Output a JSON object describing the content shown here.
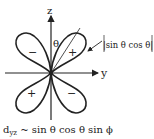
{
  "diagram": {
    "axes": {
      "vertical": "z",
      "horizontal": "y",
      "angle": "θ"
    },
    "lobes": [
      {
        "position": "upper-left",
        "sign": "−"
      },
      {
        "position": "upper-right",
        "sign": "+"
      },
      {
        "position": "lower-left",
        "sign": "+"
      },
      {
        "position": "lower-right",
        "sign": "−"
      }
    ],
    "annotation": "|sin θ cos θ|",
    "caption_main": "d",
    "caption_sub": "yz",
    "caption_rest": " ~ sin θ cos θ sin ϕ",
    "colors": {
      "stroke": "#222222",
      "background": "#ffffff"
    }
  }
}
